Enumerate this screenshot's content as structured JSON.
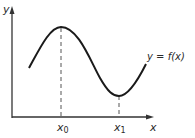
{
  "diagram": {
    "axes": {
      "x_label": "x",
      "y_label": "y"
    },
    "curve_label": "y = f(x)",
    "ticks": [
      {
        "label": "x",
        "sub": "0",
        "desc": "local maximum point"
      },
      {
        "label": "x",
        "sub": "1",
        "desc": "local minimum point"
      }
    ],
    "colors": {
      "line": "#1a1a1a",
      "axis": "#333333",
      "dashed": "#555555"
    }
  }
}
